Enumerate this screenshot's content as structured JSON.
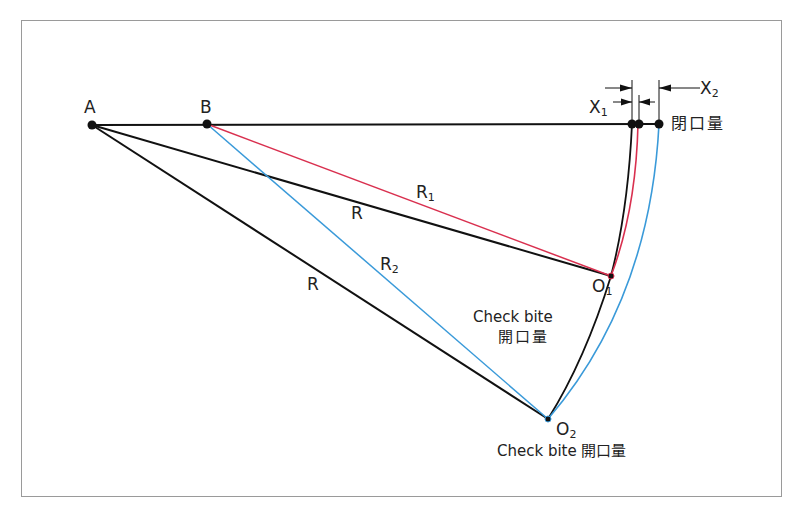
{
  "diagram": {
    "points": {
      "A": "A",
      "B": "B",
      "O1": {
        "main": "O",
        "sub": "1"
      },
      "O2": {
        "main": "O",
        "sub": "2"
      }
    },
    "radii": {
      "R_upper": "R",
      "R_lower": "R",
      "R1": {
        "main": "R",
        "sub": "1"
      },
      "R2": {
        "main": "R",
        "sub": "2"
      }
    },
    "dimensions": {
      "X1": {
        "main": "X",
        "sub": "1"
      },
      "X2": {
        "main": "X",
        "sub": "2"
      }
    },
    "annotations": {
      "closing_amount": "閉口量",
      "check_bite_mid_line1": "Check bite",
      "check_bite_mid_line2": "開口量",
      "check_bite_bottom": "Check bite 開口量"
    },
    "colors": {
      "line_black": "#111111",
      "line_red": "#d9304f",
      "line_blue": "#3a9ad9",
      "frame": "#9a9a9a"
    }
  }
}
